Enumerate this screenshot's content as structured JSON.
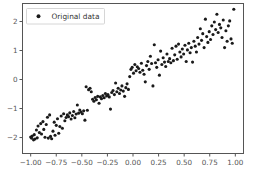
{
  "chart_data": {
    "type": "scatter",
    "title": "",
    "xlabel": "",
    "ylabel": "",
    "xlim": [
      -1.08,
      1.08
    ],
    "ylim": [
      -2.55,
      2.62
    ],
    "grid": false,
    "legend": {
      "position": "upper left",
      "entries": [
        {
          "label": "Original data",
          "marker": "circle",
          "color": "#1a1a1a"
        }
      ]
    },
    "xticks": [
      -1.0,
      -0.75,
      -0.5,
      -0.25,
      0.0,
      0.25,
      0.5,
      0.75,
      1.0
    ],
    "xticklabels": [
      "-1.00",
      "-0.75",
      "-0.50",
      "-0.25",
      "0.00",
      "0.25",
      "0.50",
      "0.75",
      "1.00"
    ],
    "yticks": [
      -2,
      -1,
      0,
      1,
      2
    ],
    "yticklabels": [
      "-2",
      "-1",
      "0",
      "1",
      "2"
    ],
    "series": [
      {
        "name": "Original data",
        "marker": "circle",
        "color": "#1a1a1a",
        "marker_size": 3.1,
        "points": [
          [
            -1.0,
            -1.98
          ],
          [
            -0.992,
            -2.02
          ],
          [
            -0.985,
            -1.95
          ],
          [
            -0.972,
            -2.08
          ],
          [
            -0.965,
            -1.9
          ],
          [
            -0.958,
            -2.05
          ],
          [
            -0.944,
            -1.74
          ],
          [
            -0.936,
            -2.01
          ],
          [
            -0.928,
            -1.6
          ],
          [
            -0.915,
            -1.83
          ],
          [
            -0.902,
            -1.52
          ],
          [
            -0.894,
            -1.88
          ],
          [
            -0.88,
            -1.45
          ],
          [
            -0.872,
            -1.72
          ],
          [
            -0.86,
            -1.99
          ],
          [
            -0.848,
            -1.55
          ],
          [
            -0.836,
            -1.3
          ],
          [
            -0.828,
            -2.02
          ],
          [
            -0.815,
            -1.22
          ],
          [
            -0.806,
            -1.96
          ],
          [
            -0.795,
            -2.04
          ],
          [
            -0.782,
            -1.78
          ],
          [
            -0.77,
            -1.47
          ],
          [
            -0.762,
            -1.92
          ],
          [
            -0.75,
            -1.58
          ],
          [
            -0.738,
            -1.35
          ],
          [
            -0.726,
            -1.85
          ],
          [
            -0.715,
            -1.62
          ],
          [
            -0.702,
            -1.26
          ],
          [
            -0.69,
            -1.68
          ],
          [
            -0.678,
            -1.18
          ],
          [
            -0.666,
            -1.42
          ],
          [
            -0.654,
            -1.31
          ],
          [
            -0.642,
            -1.22
          ],
          [
            -0.63,
            -1.28
          ],
          [
            -0.618,
            -1.15
          ],
          [
            -0.605,
            -1.36
          ],
          [
            -0.592,
            -1.24
          ],
          [
            -0.58,
            -1.1
          ],
          [
            -0.568,
            -1.32
          ],
          [
            -0.556,
            -1.19
          ],
          [
            -0.544,
            -0.88
          ],
          [
            -0.532,
            -1.16
          ],
          [
            -0.52,
            -1.05
          ],
          [
            -0.508,
            -1.12
          ],
          [
            -0.495,
            -1.18
          ],
          [
            -0.482,
            -1.08
          ],
          [
            -0.47,
            -1.4
          ],
          [
            -0.458,
            -0.25
          ],
          [
            -0.446,
            -1.06
          ],
          [
            -0.434,
            -0.35
          ],
          [
            -0.42,
            -0.3
          ],
          [
            -0.408,
            -0.42
          ],
          [
            -0.395,
            -0.68
          ],
          [
            -0.382,
            -0.75
          ],
          [
            -0.37,
            -0.62
          ],
          [
            -0.358,
            -0.7
          ],
          [
            -0.345,
            -0.58
          ],
          [
            -0.332,
            -0.82
          ],
          [
            -0.32,
            -0.6
          ],
          [
            -0.308,
            -0.66
          ],
          [
            -0.295,
            -0.55
          ],
          [
            -0.282,
            -0.63
          ],
          [
            -0.27,
            -0.48
          ],
          [
            -0.258,
            -0.57
          ],
          [
            -0.245,
            -0.52
          ],
          [
            -0.232,
            -0.6
          ],
          [
            -0.22,
            -1.02
          ],
          [
            -0.208,
            -0.45
          ],
          [
            -0.195,
            -0.38
          ],
          [
            -0.182,
            -0.52
          ],
          [
            -0.17,
            -0.12
          ],
          [
            -0.158,
            -0.42
          ],
          [
            -0.145,
            -0.3
          ],
          [
            -0.132,
            -0.48
          ],
          [
            -0.12,
            -0.36
          ],
          [
            -0.108,
            -0.22
          ],
          [
            -0.095,
            -0.4
          ],
          [
            -0.082,
            -0.58
          ],
          [
            -0.07,
            -0.28
          ],
          [
            -0.058,
            -0.15
          ],
          [
            -0.045,
            -0.34
          ],
          [
            -0.032,
            0.1
          ],
          [
            -0.02,
            0.35
          ],
          [
            -0.008,
            0.42
          ],
          [
            0.005,
            0.22
          ],
          [
            0.018,
            0.52
          ],
          [
            0.03,
            0.3
          ],
          [
            0.042,
            0.44
          ],
          [
            0.055,
            0.38
          ],
          [
            0.068,
            0.25
          ],
          [
            0.082,
            0.56
          ],
          [
            0.095,
            0.32
          ],
          [
            0.108,
            0.18
          ],
          [
            0.12,
            -0.08
          ],
          [
            0.132,
            0.48
          ],
          [
            0.145,
            0.62
          ],
          [
            0.158,
            0.35
          ],
          [
            0.17,
            0.8
          ],
          [
            0.182,
            0.55
          ],
          [
            0.195,
            -0.22
          ],
          [
            0.208,
            1.2
          ],
          [
            0.22,
            0.58
          ],
          [
            0.232,
            0.42
          ],
          [
            0.245,
            0.68
          ],
          [
            0.258,
            0.15
          ],
          [
            0.27,
            0.98
          ],
          [
            0.282,
            0.52
          ],
          [
            0.295,
            0.75
          ],
          [
            0.308,
            0.6
          ],
          [
            0.32,
            0.45
          ],
          [
            0.332,
            0.88
          ],
          [
            0.345,
            0.62
          ],
          [
            0.358,
            0.72
          ],
          [
            0.37,
            0.58
          ],
          [
            0.382,
            1.08
          ],
          [
            0.395,
            0.65
          ],
          [
            0.408,
            0.85
          ],
          [
            0.42,
            1.15
          ],
          [
            0.432,
            0.7
          ],
          [
            0.445,
            1.22
          ],
          [
            0.458,
            0.95
          ],
          [
            0.47,
            0.78
          ],
          [
            0.482,
            1.05
          ],
          [
            0.495,
            0.88
          ],
          [
            0.508,
            1.18
          ],
          [
            0.52,
            0.62
          ],
          [
            0.532,
            1.02
          ],
          [
            0.545,
            1.25
          ],
          [
            0.558,
            0.92
          ],
          [
            0.57,
            1.1
          ],
          [
            0.582,
            0.6
          ],
          [
            0.595,
            1.32
          ],
          [
            0.608,
            1.15
          ],
          [
            0.62,
            0.95
          ],
          [
            0.632,
            1.45
          ],
          [
            0.645,
            1.22
          ],
          [
            0.658,
            1.75
          ],
          [
            0.67,
            1.35
          ],
          [
            0.682,
            1.58
          ],
          [
            0.695,
            1.1
          ],
          [
            0.708,
            2.08
          ],
          [
            0.72,
            1.48
          ],
          [
            0.732,
            1.28
          ],
          [
            0.745,
            1.65
          ],
          [
            0.758,
            1.38
          ],
          [
            0.77,
            1.85
          ],
          [
            0.782,
            1.55
          ],
          [
            0.795,
            1.98
          ],
          [
            0.808,
            1.72
          ],
          [
            0.82,
            2.25
          ],
          [
            0.832,
            1.62
          ],
          [
            0.845,
            1.9
          ],
          [
            0.858,
            1.78
          ],
          [
            0.87,
            1.45
          ],
          [
            0.882,
            2.05
          ],
          [
            0.895,
            1.1
          ],
          [
            0.908,
            1.68
          ],
          [
            0.92,
            1.32
          ],
          [
            0.932,
            1.85
          ],
          [
            0.945,
            2.02
          ],
          [
            0.958,
            1.4
          ],
          [
            0.97,
            1.25
          ],
          [
            0.985,
            2.42
          ]
        ]
      }
    ]
  }
}
